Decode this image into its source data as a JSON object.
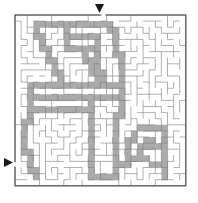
{
  "page": {
    "width": 198,
    "height": 203,
    "background": "#ffffff"
  },
  "maze": {
    "type": "rectangular-grid-maze",
    "cols": 28,
    "rows": 28,
    "cell_size": 6.1,
    "origin_x": 15,
    "origin_y": 15,
    "wall_color": "#7a7a7a",
    "border_color": "#555555",
    "shaded_color": "#aaaaaa",
    "open_color": "#ffffff",
    "wall_thickness": 0.6,
    "border_thickness": 1.2,
    "shaded_region_label": "figure-silhouette"
  },
  "entrance": {
    "name": "top-entrance",
    "marker": "triangle-down",
    "color": "#1a1a1a",
    "x": 95,
    "y": 4,
    "size": 9
  },
  "exit": {
    "name": "left-exit",
    "marker": "triangle-right",
    "color": "#1a1a1a",
    "x": 4,
    "y": 158,
    "size": 9
  },
  "chart_data": {
    "type": "heatmap",
    "xlabel": "column",
    "ylabel": "row",
    "categories": [
      "open",
      "shaded"
    ],
    "grid": true,
    "legend": "none",
    "shaded_cells": [
      [
        3,
        1
      ],
      [
        4,
        1
      ],
      [
        5,
        1
      ],
      [
        6,
        1
      ],
      [
        7,
        1
      ],
      [
        8,
        1
      ],
      [
        9,
        1
      ],
      [
        10,
        1
      ],
      [
        11,
        1
      ],
      [
        12,
        1
      ],
      [
        13,
        1
      ],
      [
        14,
        1
      ],
      [
        15,
        1
      ],
      [
        3,
        2
      ],
      [
        8,
        2
      ],
      [
        15,
        2
      ],
      [
        16,
        2
      ],
      [
        3,
        3
      ],
      [
        4,
        3
      ],
      [
        8,
        3
      ],
      [
        9,
        3
      ],
      [
        10,
        3
      ],
      [
        11,
        3
      ],
      [
        12,
        3
      ],
      [
        13,
        3
      ],
      [
        16,
        3
      ],
      [
        4,
        4
      ],
      [
        8,
        4
      ],
      [
        13,
        4
      ],
      [
        16,
        4
      ],
      [
        4,
        5
      ],
      [
        5,
        5
      ],
      [
        8,
        5
      ],
      [
        9,
        5
      ],
      [
        10,
        5
      ],
      [
        11,
        5
      ],
      [
        12,
        5
      ],
      [
        13,
        5
      ],
      [
        16,
        5
      ],
      [
        5,
        6
      ],
      [
        11,
        6
      ],
      [
        13,
        6
      ],
      [
        16,
        6
      ],
      [
        17,
        6
      ],
      [
        5,
        7
      ],
      [
        6,
        7
      ],
      [
        11,
        7
      ],
      [
        12,
        7
      ],
      [
        13,
        7
      ],
      [
        17,
        7
      ],
      [
        6,
        8
      ],
      [
        12,
        8
      ],
      [
        13,
        8
      ],
      [
        17,
        8
      ],
      [
        6,
        9
      ],
      [
        7,
        9
      ],
      [
        12,
        9
      ],
      [
        13,
        9
      ],
      [
        14,
        9
      ],
      [
        17,
        9
      ],
      [
        7,
        10
      ],
      [
        13,
        10
      ],
      [
        14,
        10
      ],
      [
        17,
        10
      ],
      [
        2,
        11
      ],
      [
        3,
        11
      ],
      [
        4,
        11
      ],
      [
        5,
        11
      ],
      [
        6,
        11
      ],
      [
        7,
        11
      ],
      [
        8,
        11
      ],
      [
        9,
        11
      ],
      [
        10,
        11
      ],
      [
        11,
        11
      ],
      [
        12,
        11
      ],
      [
        13,
        11
      ],
      [
        14,
        11
      ],
      [
        15,
        11
      ],
      [
        16,
        11
      ],
      [
        17,
        11
      ],
      [
        2,
        12
      ],
      [
        17,
        12
      ],
      [
        2,
        13
      ],
      [
        3,
        13
      ],
      [
        4,
        13
      ],
      [
        5,
        13
      ],
      [
        6,
        13
      ],
      [
        7,
        13
      ],
      [
        8,
        13
      ],
      [
        9,
        13
      ],
      [
        10,
        13
      ],
      [
        11,
        13
      ],
      [
        12,
        13
      ],
      [
        13,
        13
      ],
      [
        14,
        13
      ],
      [
        15,
        13
      ],
      [
        16,
        13
      ],
      [
        17,
        13
      ],
      [
        2,
        14
      ],
      [
        12,
        14
      ],
      [
        17,
        14
      ],
      [
        2,
        15
      ],
      [
        3,
        15
      ],
      [
        4,
        15
      ],
      [
        5,
        15
      ],
      [
        6,
        15
      ],
      [
        7,
        15
      ],
      [
        8,
        15
      ],
      [
        9,
        15
      ],
      [
        10,
        15
      ],
      [
        11,
        15
      ],
      [
        12,
        15
      ],
      [
        17,
        15
      ],
      [
        2,
        16
      ],
      [
        12,
        16
      ],
      [
        16,
        16
      ],
      [
        17,
        16
      ],
      [
        1,
        17
      ],
      [
        2,
        17
      ],
      [
        12,
        17
      ],
      [
        16,
        17
      ],
      [
        1,
        18
      ],
      [
        12,
        18
      ],
      [
        16,
        18
      ],
      [
        20,
        18
      ],
      [
        21,
        18
      ],
      [
        22,
        18
      ],
      [
        23,
        18
      ],
      [
        24,
        18
      ],
      [
        1,
        19
      ],
      [
        12,
        19
      ],
      [
        16,
        19
      ],
      [
        19,
        19
      ],
      [
        24,
        19
      ],
      [
        1,
        20
      ],
      [
        12,
        20
      ],
      [
        16,
        20
      ],
      [
        18,
        20
      ],
      [
        19,
        20
      ],
      [
        21,
        20
      ],
      [
        22,
        20
      ],
      [
        24,
        20
      ],
      [
        1,
        21
      ],
      [
        12,
        21
      ],
      [
        16,
        21
      ],
      [
        18,
        21
      ],
      [
        20,
        21
      ],
      [
        21,
        21
      ],
      [
        22,
        21
      ],
      [
        23,
        21
      ],
      [
        24,
        21
      ],
      [
        1,
        22
      ],
      [
        2,
        22
      ],
      [
        12,
        22
      ],
      [
        16,
        22
      ],
      [
        18,
        22
      ],
      [
        20,
        22
      ],
      [
        24,
        22
      ],
      [
        2,
        23
      ],
      [
        12,
        23
      ],
      [
        16,
        23
      ],
      [
        18,
        23
      ],
      [
        19,
        23
      ],
      [
        20,
        23
      ],
      [
        21,
        23
      ],
      [
        24,
        23
      ],
      [
        2,
        24
      ],
      [
        12,
        24
      ],
      [
        16,
        24
      ],
      [
        17,
        24
      ],
      [
        18,
        24
      ],
      [
        22,
        24
      ],
      [
        23,
        24
      ],
      [
        24,
        24
      ],
      [
        2,
        25
      ],
      [
        3,
        25
      ],
      [
        12,
        25
      ],
      [
        16,
        25
      ],
      [
        24,
        25
      ],
      [
        3,
        26
      ],
      [
        12,
        26
      ],
      [
        13,
        26
      ],
      [
        14,
        26
      ],
      [
        15,
        26
      ],
      [
        16,
        26
      ],
      [
        24,
        26
      ]
    ]
  }
}
